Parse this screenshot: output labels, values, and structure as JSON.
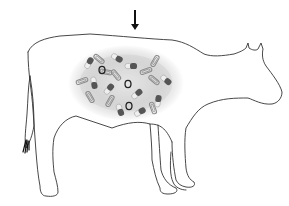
{
  "figure": {
    "colors": {
      "background": "#ffffff",
      "outline": "#333333",
      "oval_center": "#f4f4f4",
      "oval_edge": "#bdbdbd",
      "capsule_dark": "#555555",
      "capsule_light": "#eeeeee",
      "paperclip": "#8a8a8a",
      "ring": "#222222",
      "arrow": "#111111"
    },
    "arrow": {
      "direction": "down",
      "x": 135,
      "y_top": 10,
      "y_bottom": 30
    },
    "rumen_oval": {
      "cx": 126,
      "cy": 83,
      "rx": 58,
      "ry": 38
    },
    "capsules": [
      {
        "x": 89,
        "y": 63,
        "angle": -60
      },
      {
        "x": 117,
        "y": 58,
        "angle": 30
      },
      {
        "x": 131,
        "y": 66,
        "angle": 0
      },
      {
        "x": 94,
        "y": 83,
        "angle": 80
      },
      {
        "x": 109,
        "y": 89,
        "angle": -50
      },
      {
        "x": 137,
        "y": 94,
        "angle": -40
      },
      {
        "x": 166,
        "y": 80,
        "angle": 40
      },
      {
        "x": 158,
        "y": 101,
        "angle": -80
      },
      {
        "x": 120,
        "y": 110,
        "angle": 70
      },
      {
        "x": 140,
        "y": 112,
        "angle": -30
      }
    ],
    "paperclips": [
      {
        "x": 99,
        "y": 59,
        "angle": 40
      },
      {
        "x": 82,
        "y": 81,
        "angle": -20
      },
      {
        "x": 146,
        "y": 71,
        "angle": -20
      },
      {
        "x": 155,
        "y": 61,
        "angle": -60
      },
      {
        "x": 116,
        "y": 75,
        "angle": 50
      },
      {
        "x": 154,
        "y": 80,
        "angle": 40
      },
      {
        "x": 90,
        "y": 97,
        "angle": 60
      },
      {
        "x": 110,
        "y": 101,
        "angle": -60
      },
      {
        "x": 153,
        "y": 108,
        "angle": 70
      },
      {
        "x": 106,
        "y": 72,
        "angle": 10
      }
    ],
    "rings": [
      {
        "x": 102,
        "y": 70
      },
      {
        "x": 128,
        "y": 84
      },
      {
        "x": 129,
        "y": 106
      }
    ]
  }
}
